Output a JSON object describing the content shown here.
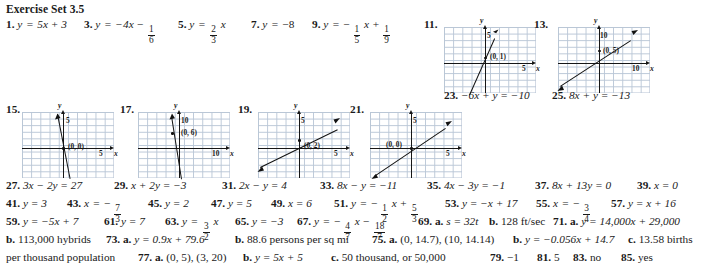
{
  "heading": "Exercise Set 3.5",
  "rows": [
    {
      "id": "row-1",
      "items": [
        {
          "n": "1.",
          "text": "y = 5x + 3",
          "x": 6,
          "y": 20
        },
        {
          "n": "3.",
          "text": "y = −4x − 1/6",
          "x": 84,
          "y": 20
        },
        {
          "n": "5.",
          "text": "y = (2/3)x",
          "x": 178,
          "y": 20
        },
        {
          "n": "7.",
          "text": "y = −8",
          "x": 251,
          "y": 20
        },
        {
          "n": "9.",
          "text": "y = −(1/5)x + 1/9",
          "x": 312,
          "y": 20
        }
      ]
    },
    {
      "id": "row-2",
      "items": [
        {
          "n": "27.",
          "text": "3x − 2y = 27",
          "x": 6,
          "y": 181
        },
        {
          "n": "29.",
          "text": "x + 2y = −3",
          "x": 114,
          "y": 181
        },
        {
          "n": "31.",
          "text": "2x − y = 4",
          "x": 222,
          "y": 181
        },
        {
          "n": "33.",
          "text": "8x − y = −11",
          "x": 320,
          "y": 181
        },
        {
          "n": "35.",
          "text": "4x − 3y = −1",
          "x": 427,
          "y": 181
        },
        {
          "n": "37.",
          "text": "8x + 13y = 0",
          "x": 535,
          "y": 181
        },
        {
          "n": "39.",
          "text": "x = 0",
          "x": 637,
          "y": 181
        }
      ]
    },
    {
      "id": "row-3",
      "items": [
        {
          "n": "41.",
          "text": "y = 3",
          "x": 6,
          "y": 199
        },
        {
          "n": "43.",
          "text": "x = −7/3",
          "x": 67,
          "y": 199
        },
        {
          "n": "45.",
          "text": "y = 2",
          "x": 148,
          "y": 199
        },
        {
          "n": "47.",
          "text": "y = 5",
          "x": 211,
          "y": 199
        },
        {
          "n": "49.",
          "text": "x = 6",
          "x": 271,
          "y": 199
        },
        {
          "n": "51.",
          "text": "y = −(1/2)x + 5/3",
          "x": 334,
          "y": 199
        },
        {
          "n": "53.",
          "text": "y = −x + 17",
          "x": 445,
          "y": 199
        },
        {
          "n": "55.",
          "text": "x = −3/4",
          "x": 536,
          "y": 199
        },
        {
          "n": "57.",
          "text": "y = x + 16",
          "x": 611,
          "y": 199
        }
      ]
    },
    {
      "id": "row-4",
      "items": [
        {
          "n": "59.",
          "text": "y = −5x + 7",
          "x": 6,
          "y": 217
        },
        {
          "n": "61.",
          "text": "y = 7",
          "x": 104,
          "y": 217
        },
        {
          "n": "63.",
          "text": "y = (3/2)x",
          "x": 165,
          "y": 217
        },
        {
          "n": "65.",
          "text": "y = −3",
          "x": 235,
          "y": 217
        },
        {
          "n": "67.",
          "text": "y = −(4/7)x − 18/7",
          "x": 297,
          "y": 217
        },
        {
          "n": "69. a.",
          "text": "s = 32t",
          "x": 418,
          "y": 217
        },
        {
          "n": "b.",
          "text": "128 ft/sec",
          "x": 489,
          "y": 217
        },
        {
          "n": "71. a.",
          "text": "y = 14,000x + 29,000",
          "x": 553,
          "y": 217
        }
      ]
    },
    {
      "id": "row-5",
      "items": [
        {
          "n": "b.",
          "text": "113,000 hybrids",
          "x": 6,
          "y": 235
        },
        {
          "n": "73. a.",
          "text": "y = 0.9x + 79.6",
          "x": 106,
          "y": 235
        },
        {
          "n": "b.",
          "text": "88.6 persons per sq mi",
          "x": 235,
          "y": 235
        },
        {
          "n": "75. a.",
          "text": "(0, 14.7), (10, 14.14)",
          "x": 372,
          "y": 235
        },
        {
          "n": "b.",
          "text": "y = −0.056x + 14.7",
          "x": 513,
          "y": 235
        },
        {
          "n": "c.",
          "text": "13.58 births",
          "x": 628,
          "y": 235
        }
      ]
    },
    {
      "id": "row-6",
      "items": [
        {
          "n": "",
          "text": "per thousand population",
          "x": 6,
          "y": 253
        },
        {
          "n": "77. a.",
          "text": "(0, 5), (3, 20)",
          "x": 138,
          "y": 253
        },
        {
          "n": "b.",
          "text": "y = 5x + 5",
          "x": 243,
          "y": 253
        },
        {
          "n": "c.",
          "text": "50 thousand, or 50,000",
          "x": 331,
          "y": 253
        },
        {
          "n": "79.",
          "text": "−1",
          "x": 490,
          "y": 253
        },
        {
          "n": "81.",
          "text": "5",
          "x": 537,
          "y": 253
        },
        {
          "n": "83.",
          "text": "no",
          "x": 573,
          "y": 253
        },
        {
          "n": "85.",
          "text": "yes",
          "x": 621,
          "y": 253
        }
      ]
    }
  ],
  "inline_equations": {
    "e1": {
      "label": "1.",
      "lhs": "y",
      "rhs": "5x + 3"
    },
    "e3": {
      "label": "3.",
      "lhs": "y",
      "rhs": "−4x −",
      "frac": {
        "n": "1",
        "d": "6"
      }
    },
    "e5": {
      "label": "5.",
      "lhs": "y",
      "rhs": "",
      "frac": {
        "n": "2",
        "d": "3"
      },
      "tail": "x"
    },
    "e7": {
      "label": "7.",
      "lhs": "y",
      "rhs": "−8"
    },
    "e9": {
      "label": "9.",
      "lhs": "y",
      "rhs": "−",
      "frac": {
        "n": "1",
        "d": "5"
      },
      "tail": "x +",
      "frac2": {
        "n": "1",
        "d": "9"
      }
    },
    "e43": {
      "label": "43.",
      "lhs": "x",
      "rhs": "−",
      "frac": {
        "n": "7",
        "d": "3"
      }
    },
    "e51": {
      "label": "51.",
      "lhs": "y",
      "rhs": "−",
      "frac": {
        "n": "1",
        "d": "2"
      },
      "tail": "x +",
      "frac2": {
        "n": "5",
        "d": "3"
      }
    },
    "e55": {
      "label": "55.",
      "lhs": "x",
      "rhs": "−",
      "frac": {
        "n": "3",
        "d": "4"
      }
    },
    "e63": {
      "label": "63.",
      "lhs": "y",
      "rhs": "",
      "frac": {
        "n": "3",
        "d": "2"
      },
      "tail": "x"
    },
    "e67": {
      "label": "67.",
      "lhs": "y",
      "rhs": "−",
      "frac": {
        "n": "4",
        "d": "7"
      },
      "tail": "x −",
      "frac2": {
        "n": "18",
        "d": "7"
      }
    }
  },
  "graphs": [
    {
      "label": "11.",
      "xlabel": "x",
      "ylabel": "y",
      "xtick": "5",
      "ytick": "5",
      "point_label": "(0, 1)",
      "intercept": 1,
      "slope": 3,
      "scale": 5
    },
    {
      "label": "13.",
      "xlabel": "x",
      "ylabel": "y",
      "xtick": "10",
      "ytick": "10",
      "point_label": "(0, 5)",
      "intercept": 5,
      "slope": 1,
      "scale": 10
    },
    {
      "label": "15.",
      "xlabel": "x",
      "ylabel": "y",
      "xtick": "5",
      "ytick": "5",
      "point_label": "(0, 0)",
      "intercept": 0,
      "slope": -6,
      "scale": 5
    },
    {
      "label": "17.",
      "xlabel": "x",
      "ylabel": "y",
      "xtick": "10",
      "ytick": "10",
      "point_label": "(0, 6)",
      "intercept": 6,
      "slope": -8,
      "scale": 10
    },
    {
      "label": "19.",
      "xlabel": "x",
      "ylabel": "y",
      "xtick": "5",
      "ytick": "5",
      "point_label": "(0, 2)",
      "intercept": 2,
      "slope": 0.62,
      "scale": 5
    },
    {
      "label": "21.",
      "xlabel": "x",
      "ylabel": "y",
      "xtick": "5",
      "ytick": "5",
      "point_label": "(0, 0)",
      "intercept": 0,
      "slope": 0.8,
      "scale": 5
    }
  ],
  "graph_answers": [
    {
      "n": "23.",
      "text": "−6x + y = −10",
      "x": 444,
      "y": 91
    },
    {
      "n": "25.",
      "text": "8x + y = −13",
      "x": 552,
      "y": 91
    }
  ],
  "colors": {
    "grid": "#b9c6d6",
    "axis": "#161616",
    "ink": "#1a1a1a"
  }
}
